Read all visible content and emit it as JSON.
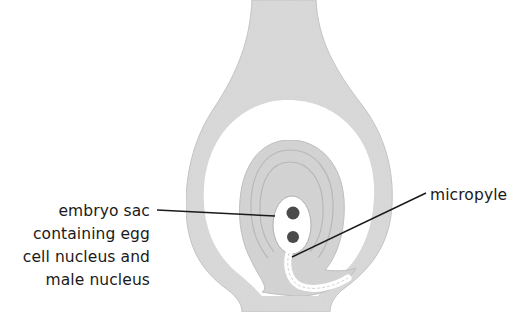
{
  "diagram": {
    "colors": {
      "tissue": "#d9d9d9",
      "tissue_edge": "#bdbdbd",
      "cavity": "#ffffff",
      "nucleus": "#4a4a4a",
      "leader_line": "#1a1a1a",
      "text": "#1a1a1a"
    },
    "labels": {
      "embryo_sac": {
        "lines": [
          "embryo sac",
          "containing egg",
          "cell nucleus and",
          "male nucleus"
        ]
      },
      "micropyle": {
        "text": "micropyle"
      }
    }
  }
}
